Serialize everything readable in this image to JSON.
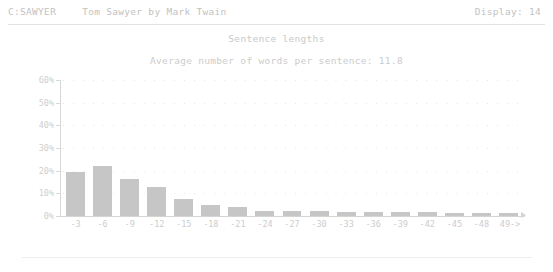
{
  "statusbar": {
    "file_id": "C:SAWYER",
    "document_title": "Tom Sawyer by Mark Twain",
    "display_label": "Display: 14"
  },
  "chart_data": {
    "type": "bar",
    "title": "Sentence lengths",
    "subtitle": "Average number of words per sentence: 11.8",
    "xlabel": "",
    "ylabel": "",
    "ylim": [
      0,
      60
    ],
    "grid": true,
    "legend": false,
    "y_ticks": [
      "60%",
      "50%",
      "40%",
      "30%",
      "20%",
      "10%",
      "0%"
    ],
    "y_tick_values": [
      60,
      50,
      40,
      30,
      20,
      10,
      0
    ],
    "categories": [
      "-3",
      "-6",
      "-9",
      "-12",
      "-15",
      "-18",
      "-21",
      "-24",
      "-27",
      "-30",
      "-33",
      "-36",
      "-39",
      "-42",
      "-45",
      "-48",
      "49->"
    ],
    "values": [
      19.5,
      22.0,
      16.5,
      13.0,
      7.5,
      5.0,
      4.0,
      2.2,
      2.0,
      2.0,
      1.8,
      1.8,
      1.6,
      1.6,
      1.5,
      1.5,
      1.4
    ],
    "bar_color": "#c6c6c6"
  }
}
